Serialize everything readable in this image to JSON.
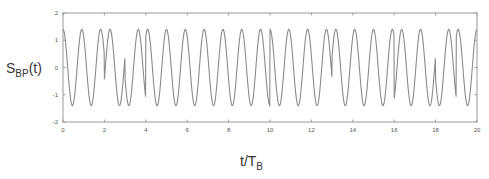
{
  "chart_data": {
    "type": "line",
    "title": "",
    "xlabel": "t/T_B",
    "ylabel": "S_BP(t)",
    "xlabel_parts": {
      "main": "t/T",
      "sub": "B"
    },
    "ylabel_parts": {
      "main": "S",
      "sub": "BP",
      "suffix": "(t)"
    },
    "xlim": [
      0,
      20
    ],
    "ylim": [
      -2,
      2
    ],
    "x_ticks": [
      "0",
      "2",
      "4",
      "6",
      "8",
      "10",
      "12",
      "14",
      "16",
      "18",
      "20"
    ],
    "y_ticks": [
      "2",
      "1",
      "0",
      "-1",
      "-2"
    ],
    "grid": false,
    "legend": null,
    "series": [
      {
        "name": "BPSK bandpass signal",
        "color": "#8a8a8a",
        "amplitude": 1.4,
        "carrier_cycles_per_bit": 1.1,
        "bit_period": 1,
        "bits": [
          1,
          1,
          -1,
          1,
          -1,
          -1,
          -1,
          -1,
          -1,
          -1,
          1,
          1,
          1,
          -1,
          -1,
          -1,
          1,
          1,
          -1,
          1
        ]
      }
    ]
  }
}
